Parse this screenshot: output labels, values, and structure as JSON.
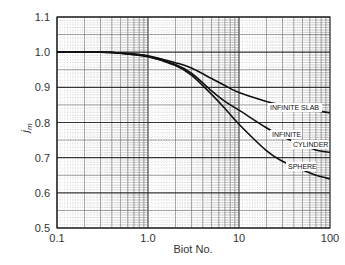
{
  "chart_data": {
    "type": "line",
    "title": "",
    "xlabel": "Biot No.",
    "ylabel": "j_m",
    "xscale": "log",
    "xlim": [
      0.1,
      100
    ],
    "ylim": [
      0.5,
      1.1
    ],
    "grid": true,
    "legend_position": "inline labels near right end of curves",
    "x_ticks": [
      "0.1",
      "1.0",
      "10",
      "100"
    ],
    "y_ticks": [
      "0.5",
      "0.6",
      "0.7",
      "0.8",
      "0.9",
      "1.0",
      "1.1"
    ],
    "x": [
      0.1,
      0.3,
      0.5,
      1.0,
      2.0,
      3.0,
      5.0,
      7.0,
      10,
      20,
      30,
      50,
      70,
      100
    ],
    "series": [
      {
        "name": "INFINITE SLAB",
        "values": [
          1.0,
          1.0,
          0.998,
          0.99,
          0.97,
          0.955,
          0.925,
          0.905,
          0.885,
          0.86,
          0.85,
          0.84,
          0.833,
          0.828
        ]
      },
      {
        "name": "INFINITE CYLINDER",
        "values": [
          1.0,
          1.0,
          0.997,
          0.988,
          0.965,
          0.94,
          0.89,
          0.86,
          0.835,
          0.785,
          0.76,
          0.735,
          0.722,
          0.715
        ]
      },
      {
        "name": "SPHERE",
        "values": [
          1.0,
          1.0,
          0.997,
          0.987,
          0.962,
          0.935,
          0.88,
          0.84,
          0.795,
          0.72,
          0.69,
          0.665,
          0.65,
          0.64
        ]
      }
    ],
    "annotations": [
      {
        "text": "INFINITE SLAB",
        "series": "INFINITE SLAB"
      },
      {
        "text": "INFINITE",
        "series": "INFINITE CYLINDER"
      },
      {
        "text": "CYLINDER",
        "series": "INFINITE CYLINDER"
      },
      {
        "text": "SPHERE",
        "series": "SPHERE"
      }
    ]
  },
  "labels": {
    "xlabel": "Biot No.",
    "ylabel_main": "j",
    "ylabel_sub": "m",
    "slab": "INFINITE SLAB",
    "cyl1": "INFINITE",
    "cyl2": "CYLINDER",
    "sphere": "SPHERE"
  },
  "colors": {
    "curve": "#111111",
    "grid_major": "#222222",
    "grid_minor": "#666666",
    "background": "#ffffff"
  }
}
